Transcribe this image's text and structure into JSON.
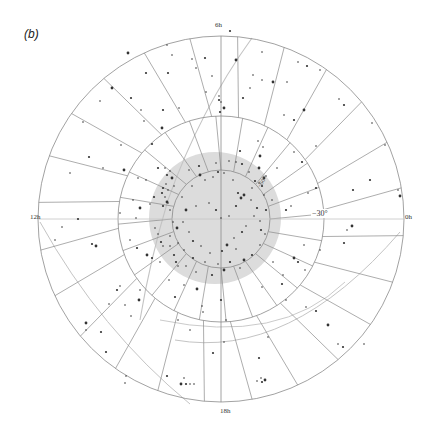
{
  "panel_label": "(b)",
  "colors": {
    "grid": "#8a8a8a",
    "curve": "#c4c4c4",
    "zone_fill": "#dcdcdc",
    "star": "#333333"
  },
  "labels": {
    "ra_top": "6h",
    "ra_left": "12h",
    "ra_right": "0h",
    "ra_bottom": "18h",
    "dec_middle": "−30°",
    "dec_inner": "−60°"
  },
  "chart_data": {
    "type": "scatter",
    "title": "(b)",
    "projection": "polar sky map centred on the south celestial pole",
    "center_px": [
      221,
      219
    ],
    "ra_labels": [
      {
        "label": "0h",
        "position": "right"
      },
      {
        "label": "6h",
        "position": "top"
      },
      {
        "label": "12h",
        "position": "left"
      },
      {
        "label": "18h",
        "position": "bottom"
      }
    ],
    "declination_circles": [
      {
        "label": "−60°",
        "radius_px": 49
      },
      {
        "label": "−30°",
        "radius_px": 103
      },
      {
        "label": "0°",
        "radius_px": 183
      }
    ],
    "radial_divisions": 24,
    "shaded_zone": {
      "center_px": [
        215,
        218
      ],
      "radius_px": 66
    },
    "xlabel": "",
    "ylabel": "",
    "grid": true,
    "legend": null,
    "points_px": [
      [
        128,
        53
      ],
      [
        167,
        45
      ],
      [
        172,
        55
      ],
      [
        168,
        73
      ],
      [
        192,
        59
      ],
      [
        196,
        68
      ],
      [
        146,
        73
      ],
      [
        112,
        88
      ],
      [
        100,
        101
      ],
      [
        131,
        98
      ],
      [
        141,
        110
      ],
      [
        144,
        121
      ],
      [
        163,
        110
      ],
      [
        179,
        108
      ],
      [
        162,
        128
      ],
      [
        152,
        144
      ],
      [
        121,
        145
      ],
      [
        83,
        122
      ],
      [
        89,
        157
      ],
      [
        103,
        168
      ],
      [
        70,
        173
      ],
      [
        124,
        170
      ],
      [
        138,
        178
      ],
      [
        146,
        180
      ],
      [
        158,
        168
      ],
      [
        165,
        168
      ],
      [
        170,
        171
      ],
      [
        167,
        175
      ],
      [
        172,
        178
      ],
      [
        166,
        184
      ],
      [
        163,
        188
      ],
      [
        168,
        190
      ],
      [
        174,
        186
      ],
      [
        162,
        193
      ],
      [
        165,
        197
      ],
      [
        167,
        202
      ],
      [
        163,
        206
      ],
      [
        170,
        210
      ],
      [
        168,
        203
      ],
      [
        154,
        197
      ],
      [
        150,
        204
      ],
      [
        133,
        200
      ],
      [
        140,
        208
      ],
      [
        136,
        218
      ],
      [
        120,
        213
      ],
      [
        78,
        219
      ],
      [
        62,
        227
      ],
      [
        55,
        240
      ],
      [
        92,
        244
      ],
      [
        96,
        246
      ],
      [
        130,
        240
      ],
      [
        137,
        248
      ],
      [
        155,
        228
      ],
      [
        158,
        234
      ],
      [
        161,
        242
      ],
      [
        163,
        246
      ],
      [
        147,
        255
      ],
      [
        152,
        258
      ],
      [
        160,
        262
      ],
      [
        170,
        246
      ],
      [
        174,
        255
      ],
      [
        178,
        266
      ],
      [
        140,
        290
      ],
      [
        139,
        300
      ],
      [
        125,
        305
      ],
      [
        120,
        286
      ],
      [
        117,
        290
      ],
      [
        109,
        304
      ],
      [
        131,
        316
      ],
      [
        101,
        332
      ],
      [
        86,
        323
      ],
      [
        86,
        330
      ],
      [
        106,
        352
      ],
      [
        125,
        383
      ],
      [
        126,
        376
      ],
      [
        167,
        376
      ],
      [
        184,
        378
      ],
      [
        181,
        384
      ],
      [
        186,
        384
      ],
      [
        190,
        384
      ],
      [
        194,
        384
      ],
      [
        213,
        353
      ],
      [
        203,
        312
      ],
      [
        202,
        306
      ],
      [
        197,
        289
      ],
      [
        184,
        285
      ],
      [
        169,
        280
      ],
      [
        175,
        297
      ],
      [
        190,
        330
      ],
      [
        178,
        320
      ],
      [
        230,
        31
      ],
      [
        236,
        60
      ],
      [
        262,
        52
      ],
      [
        243,
        98
      ],
      [
        250,
        88
      ],
      [
        219,
        96
      ],
      [
        219,
        100
      ],
      [
        221,
        102
      ],
      [
        224,
        108
      ],
      [
        220,
        112
      ],
      [
        206,
        92
      ],
      [
        212,
        76
      ],
      [
        205,
        58
      ],
      [
        253,
        75
      ],
      [
        262,
        80
      ],
      [
        273,
        82
      ],
      [
        287,
        82
      ],
      [
        298,
        62
      ],
      [
        307,
        66
      ],
      [
        320,
        70
      ],
      [
        284,
        115
      ],
      [
        294,
        120
      ],
      [
        304,
        110
      ],
      [
        339,
        99
      ],
      [
        344,
        105
      ],
      [
        372,
        123
      ],
      [
        385,
        145
      ],
      [
        370,
        180
      ],
      [
        398,
        190
      ],
      [
        400,
        196
      ],
      [
        353,
        190
      ],
      [
        316,
        146
      ],
      [
        294,
        152
      ],
      [
        302,
        162
      ],
      [
        266,
        176
      ],
      [
        277,
        168
      ],
      [
        260,
        156
      ],
      [
        263,
        147
      ],
      [
        258,
        141
      ],
      [
        240,
        151
      ],
      [
        236,
        162
      ],
      [
        259,
        183
      ],
      [
        262,
        186
      ],
      [
        264,
        178
      ],
      [
        272,
        200
      ],
      [
        286,
        210
      ],
      [
        291,
        206
      ],
      [
        308,
        193
      ],
      [
        316,
        188
      ],
      [
        347,
        230
      ],
      [
        352,
        226
      ],
      [
        344,
        243
      ],
      [
        320,
        250
      ],
      [
        304,
        245
      ],
      [
        298,
        262
      ],
      [
        273,
        262
      ],
      [
        283,
        275
      ],
      [
        294,
        258
      ],
      [
        305,
        270
      ],
      [
        262,
        287
      ],
      [
        282,
        284
      ],
      [
        286,
        300
      ],
      [
        306,
        307
      ],
      [
        316,
        311
      ],
      [
        328,
        325
      ],
      [
        338,
        344
      ],
      [
        343,
        347
      ],
      [
        364,
        344
      ],
      [
        268,
        337
      ],
      [
        259,
        358
      ],
      [
        261,
        378
      ],
      [
        265,
        380
      ],
      [
        262,
        382
      ],
      [
        257,
        381
      ],
      [
        224,
        342
      ],
      [
        221,
        300
      ],
      [
        226,
        320
      ],
      [
        192,
        186
      ],
      [
        200,
        175
      ],
      [
        205,
        180
      ],
      [
        213,
        177
      ],
      [
        218,
        172
      ],
      [
        224,
        173
      ],
      [
        233,
        180
      ],
      [
        238,
        193
      ],
      [
        244,
        195
      ],
      [
        251,
        200
      ],
      [
        257,
        208
      ],
      [
        254,
        216
      ],
      [
        246,
        226
      ],
      [
        242,
        232
      ],
      [
        234,
        238
      ],
      [
        227,
        245
      ],
      [
        222,
        251
      ],
      [
        210,
        253
      ],
      [
        201,
        246
      ],
      [
        193,
        241
      ],
      [
        189,
        232
      ],
      [
        183,
        222
      ],
      [
        186,
        210
      ],
      [
        196,
        206
      ],
      [
        209,
        203
      ],
      [
        216,
        210
      ],
      [
        221,
        218
      ],
      [
        229,
        216
      ],
      [
        236,
        206
      ],
      [
        241,
        198
      ],
      [
        252,
        188
      ],
      [
        255,
        181
      ],
      [
        249,
        172
      ],
      [
        260,
        221
      ],
      [
        261,
        230
      ],
      [
        236,
        249
      ],
      [
        244,
        260
      ],
      [
        230,
        262
      ],
      [
        218,
        264
      ],
      [
        205,
        262
      ],
      [
        193,
        258
      ],
      [
        178,
        243
      ],
      [
        184,
        250
      ],
      [
        177,
        228
      ],
      [
        182,
        197
      ],
      [
        189,
        170
      ],
      [
        199,
        166
      ],
      [
        216,
        163
      ],
      [
        229,
        161
      ],
      [
        242,
        164
      ],
      [
        259,
        168
      ],
      [
        264,
        195
      ],
      [
        266,
        210
      ],
      [
        265,
        234
      ],
      [
        260,
        245
      ],
      [
        252,
        255
      ],
      [
        240,
        268
      ],
      [
        224,
        270
      ],
      [
        212,
        275
      ],
      [
        196,
        272
      ],
      [
        186,
        266
      ],
      [
        176,
        262
      ],
      [
        170,
        236
      ],
      [
        173,
        222
      ]
    ]
  }
}
